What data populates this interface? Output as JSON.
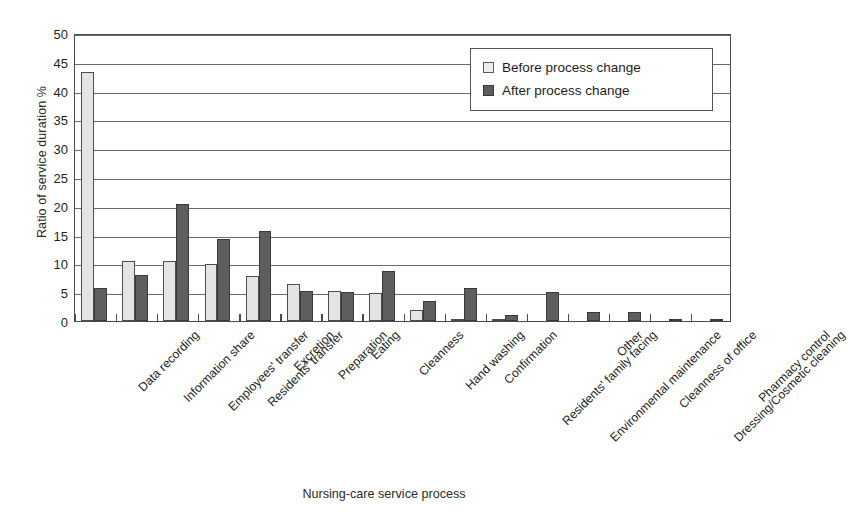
{
  "chart_data": {
    "type": "bar",
    "title": "",
    "xlabel": "Nursing-care service process",
    "ylabel": "Ratio of service duration  %",
    "ylim": [
      0,
      50
    ],
    "ytick_step": 5,
    "yticks": [
      0,
      5,
      10,
      15,
      20,
      25,
      30,
      35,
      40,
      45,
      50
    ],
    "grid": "horizontal",
    "legend_position": "top-right",
    "categories": [
      "Data recording",
      "Information share",
      "Employees' transfer",
      "Residents' transfer",
      "Excretion",
      "Preparation",
      "Eating",
      "Cleanness",
      "Hand washing",
      "Confirmation",
      "Residents' family facing",
      "Environmental maintenance",
      "Other",
      "Cleanness of office",
      "Dressing/Cosmetic cleaning",
      "Pharmacy control"
    ],
    "series": [
      {
        "name": "Before process change",
        "color": "#e4e4e4",
        "values": [
          43.3,
          10.5,
          10.5,
          9.9,
          7.8,
          6.4,
          5.2,
          4.9,
          1.9,
          0.3,
          0.2,
          0.0,
          0.0,
          0.0,
          0.0,
          0.0
        ]
      },
      {
        "name": "After process change",
        "color": "#5e5e5e",
        "values": [
          5.7,
          8.0,
          20.3,
          14.2,
          15.6,
          5.2,
          5.0,
          8.7,
          3.4,
          5.7,
          1.0,
          5.1,
          1.5,
          1.5,
          0.4,
          0.3
        ]
      }
    ]
  },
  "legend": {
    "items": [
      {
        "label": "Before process change",
        "swatch": "light-square-icon"
      },
      {
        "label": "After process change",
        "swatch": "dark-square-icon"
      }
    ]
  },
  "axes": {
    "y_title": "Ratio of service duration  %",
    "x_title": "Nursing-care service process",
    "y_tick_labels": [
      "50",
      "45",
      "40",
      "35",
      "30",
      "25",
      "20",
      "15",
      "10",
      "5",
      "0"
    ]
  }
}
